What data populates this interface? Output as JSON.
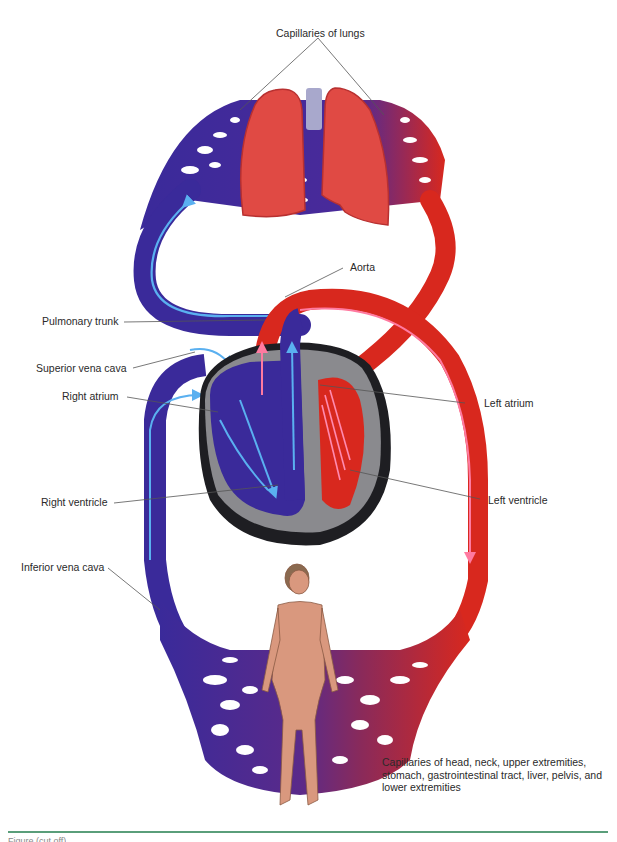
{
  "figure": {
    "colors": {
      "deoxygenated": "#3a2a9a",
      "oxygenated": "#d8281e",
      "flow_arrow_blue": "#5ab0f0",
      "flow_arrow_red": "#ff7aa0",
      "heart_wall": "#8a8a8e",
      "heart_outer": "#1e1e22",
      "lung": "#e04a44",
      "skin": "#d9987e",
      "leader_line": "#555555",
      "footer_rule": "#5a9e7a"
    },
    "labels": {
      "capillaries_lungs": "Capillaries of lungs",
      "aorta": "Aorta",
      "pulmonary_trunk": "Pulmonary trunk",
      "superior_vena_cava": "Superior vena cava",
      "right_atrium": "Right atrium",
      "left_atrium": "Left atrium",
      "right_ventricle": "Right ventricle",
      "left_ventricle": "Left ventricle",
      "inferior_vena_cava": "Inferior vena cava",
      "capillaries_body": "Capillaries of head, neck, upper extremities, stomach, gastrointestinal tract, liver, pelvis, and lower extremities"
    },
    "caption": "Figure (cut off)"
  }
}
